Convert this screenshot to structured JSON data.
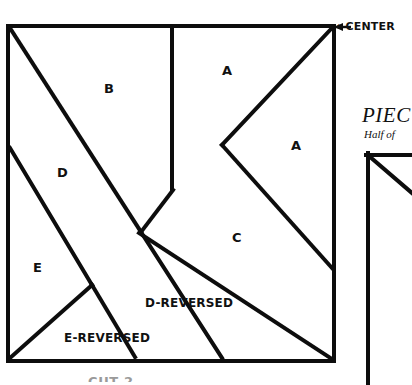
{
  "figure": {
    "title_callout": "←CENTER",
    "main_square": {
      "name": "main-construction-square",
      "x": 8,
      "y": 26,
      "width": 326,
      "height": 335
    },
    "piece_labels": [
      {
        "id": "a-top",
        "text": "A",
        "x": 222,
        "y": 64,
        "style": "single"
      },
      {
        "id": "a-right",
        "text": "A",
        "x": 291,
        "y": 139,
        "style": "single"
      },
      {
        "id": "b",
        "text": "B",
        "x": 104,
        "y": 82,
        "style": "single"
      },
      {
        "id": "c",
        "text": "C",
        "x": 232,
        "y": 231,
        "style": "single"
      },
      {
        "id": "d",
        "text": "D",
        "x": 57,
        "y": 166,
        "style": "single"
      },
      {
        "id": "e",
        "text": "E",
        "x": 33,
        "y": 261,
        "style": "single"
      },
      {
        "id": "d-reversed",
        "text": "D-REVERSED",
        "x": 145,
        "y": 297,
        "style": "rev"
      },
      {
        "id": "e-reversed",
        "text": "E-REVERSED",
        "x": 64,
        "y": 332,
        "style": "rev"
      }
    ],
    "stroke_color": "#0d0d0d",
    "background_color": "#ffffff"
  },
  "side_panel": {
    "heading": "PIEC",
    "subheading": "Half of",
    "shape_name": "panel-square-with-diagonal"
  },
  "bottom_clipped_text": "CUT 2"
}
